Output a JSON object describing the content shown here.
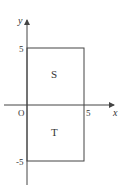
{
  "diagram": {
    "axes": {
      "x_label": "x",
      "y_label": "y",
      "origin_label": "O",
      "x_tick": "5",
      "y_tick_pos": "5",
      "y_tick_neg": "-5"
    },
    "regions": [
      {
        "name": "S",
        "label": "S",
        "x_range": [
          0,
          5
        ],
        "y_range": [
          0,
          5
        ]
      },
      {
        "name": "T",
        "label": "T",
        "x_range": [
          0,
          5
        ],
        "y_range": [
          -5,
          0
        ]
      }
    ],
    "colors": {
      "line": "#444444",
      "text": "#333333"
    }
  }
}
